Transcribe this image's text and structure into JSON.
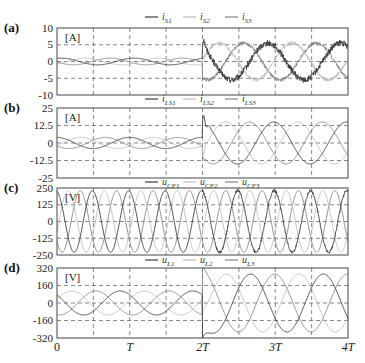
{
  "colors": {
    "s1": "#3c3c3c",
    "s2": "#bdbdbd",
    "s3": "#858585",
    "frame": "#444444",
    "grid": "#555555"
  },
  "x_axis": {
    "ticks": [
      "0",
      "T",
      "2T",
      "3T",
      "4T"
    ],
    "range": [
      0,
      4
    ],
    "unit": "T"
  },
  "chart_data": [
    {
      "type": "line",
      "panel": "(a)",
      "unit_label": "[A]",
      "legend": [
        "i_S1",
        "i_S2",
        "i_S3"
      ],
      "legend_display": [
        {
          "main": "i",
          "sub": "S1"
        },
        {
          "main": "i",
          "sub": "S2"
        },
        {
          "main": "i",
          "sub": "S3"
        }
      ],
      "ylim": [
        -10,
        10
      ],
      "yticks": [
        "10",
        "5",
        "0",
        "-5",
        "-10"
      ],
      "ytick_values": [
        10,
        5,
        0,
        -5,
        -10
      ],
      "grid": true,
      "series_description": "0–2T: small three-phase sinusoids amplitude ≈1 A; after 2T: amplitude ≈5.5 A with high-frequency ripple, initial spike to ≈7 A at 2T",
      "series": [
        {
          "name": "i_S1",
          "amp_before": 1.0,
          "amp_after": 5.5,
          "ripple_after": 0.8
        },
        {
          "name": "i_S2",
          "amp_before": 1.0,
          "amp_after": 5.5,
          "ripple_after": 0.5
        },
        {
          "name": "i_S3",
          "amp_before": 1.0,
          "amp_after": 5.5,
          "ripple_after": 0.5
        }
      ]
    },
    {
      "type": "line",
      "panel": "(b)",
      "unit_label": "[A]",
      "legend": [
        "i_LS1",
        "i_LS2",
        "i_LS3"
      ],
      "legend_display": [
        {
          "main": "i",
          "sub": "LS1"
        },
        {
          "main": "i",
          "sub": "LS2"
        },
        {
          "main": "i",
          "sub": "LS3"
        }
      ],
      "ylim": [
        -25,
        25
      ],
      "yticks": [
        "25",
        "12.5",
        "0",
        "-12.5",
        "-25"
      ],
      "ytick_values": [
        25,
        12.5,
        0,
        -12.5,
        -25
      ],
      "grid": true,
      "series_description": "0–2T: sinusoids amplitude ≈4 A; after 2T: amplitude ≈15 A, transient spike ≈20 A at 2T",
      "series": [
        {
          "name": "i_LS1",
          "amp_before": 4,
          "amp_after": 15
        },
        {
          "name": "i_LS2",
          "amp_before": 4,
          "amp_after": 15
        },
        {
          "name": "i_LS3",
          "amp_before": 4,
          "amp_after": 15
        }
      ]
    },
    {
      "type": "line",
      "panel": "(c)",
      "unit_label": "[V]",
      "legend": [
        "u_CF1",
        "u_CF2",
        "u_CF3"
      ],
      "legend_display": [
        {
          "main": "u",
          "sub": "CF1"
        },
        {
          "main": "u",
          "sub": "CF2"
        },
        {
          "main": "u",
          "sub": "CF3"
        }
      ],
      "ylim": [
        -250,
        250
      ],
      "yticks": [
        "250",
        "125",
        "0",
        "-125",
        "-250"
      ],
      "ytick_values": [
        250,
        125,
        0,
        -125,
        -250
      ],
      "grid": true,
      "series_description": "Three-phase sinusoids amplitude ≈230 V at 2 cycles per T; small ripple on phase 1 after 2T",
      "series": [
        {
          "name": "u_CF1",
          "amplitude": 230,
          "cycles_per_T": 2
        },
        {
          "name": "u_CF2",
          "amplitude": 230,
          "cycles_per_T": 2
        },
        {
          "name": "u_CF3",
          "amplitude": 230,
          "cycles_per_T": 2
        }
      ]
    },
    {
      "type": "line",
      "panel": "(d)",
      "unit_label": "[V]",
      "legend": [
        "u_L1",
        "u_L2",
        "u_L3"
      ],
      "legend_display": [
        {
          "main": "u",
          "sub": "L1"
        },
        {
          "main": "u",
          "sub": "L2"
        },
        {
          "main": "u",
          "sub": "L3"
        }
      ],
      "ylim": [
        -320,
        320
      ],
      "yticks": [
        "320",
        "160",
        "0",
        "-160",
        "-320"
      ],
      "ytick_values": [
        320,
        160,
        0,
        -160,
        -320
      ],
      "grid": true,
      "series_description": "0–2T: sinusoids amplitude ≈110 V (one cycle per T); after 2T: amplitude ≈265 V, transient dip to ≈-300 V at 2T",
      "series": [
        {
          "name": "u_L1",
          "amp_before": 110,
          "amp_after": 265
        },
        {
          "name": "u_L2",
          "amp_before": 110,
          "amp_after": 265
        },
        {
          "name": "u_L3",
          "amp_before": 110,
          "amp_after": 265
        }
      ]
    }
  ]
}
